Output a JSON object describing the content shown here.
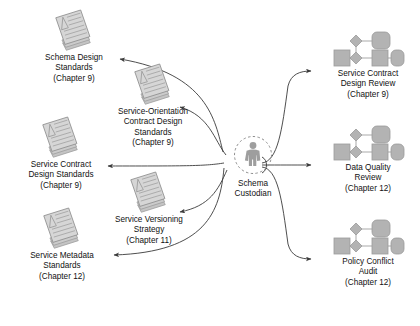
{
  "diagram": {
    "colors": {
      "doc_fill": "#cfcfcf",
      "doc_edge": "#9a9a9a",
      "doc_line": "#a8a8a8",
      "shape_fill": "#b3b3b3",
      "shape_edge": "#9b9b9b",
      "actor_fill": "#9e9e9e",
      "arrow": "#3a3a3a",
      "text": "#111111",
      "background": "#ffffff"
    },
    "center": {
      "icon": "person-actor-icon",
      "circle": "dashed-circle",
      "label_lines": [
        "Schema",
        "Custodian"
      ]
    },
    "inputs": [
      {
        "icon": "document-stack-icon",
        "label_lines": [
          "Schema Design",
          "Standards",
          "(Chapter 9)"
        ]
      },
      {
        "icon": "document-stack-icon",
        "label_lines": [
          "Service-Orientation",
          "Contract Design",
          "Standards",
          "(Chapter 9)"
        ]
      },
      {
        "icon": "document-stack-icon",
        "label_lines": [
          "Service Contract",
          "Design Standards",
          "(Chapter 9)"
        ]
      },
      {
        "icon": "document-stack-icon",
        "label_lines": [
          "Service Versioning",
          "Strategy",
          "(Chapter 11)"
        ]
      },
      {
        "icon": "document-stack-icon",
        "label_lines": [
          "Service Metadata",
          "Standards",
          "(Chapter 12)"
        ]
      }
    ],
    "outputs": [
      {
        "icon": "process-flow-icon",
        "label_lines": [
          "Service Contract",
          "Design Review",
          "(Chapter 9)"
        ]
      },
      {
        "icon": "process-flow-icon",
        "label_lines": [
          "Data Quality",
          "Review",
          "(Chapter 12)"
        ]
      },
      {
        "icon": "process-flow-icon",
        "label_lines": [
          "Policy Conflict",
          "Audit",
          "(Chapter 12)"
        ]
      }
    ]
  }
}
